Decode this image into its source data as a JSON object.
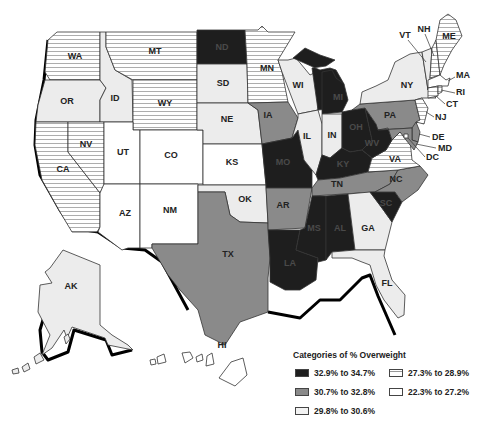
{
  "legend": {
    "title": "Categories of % Overweight",
    "categories": [
      {
        "label": "32.9% to 34.7%",
        "fill": "#1e1e1e",
        "pattern": "solid-dark"
      },
      {
        "label": "30.7% to 32.8%",
        "fill": "#8a8a8a",
        "pattern": "solid-gray"
      },
      {
        "label": "29.8% to 30.6%",
        "fill": "#ececec",
        "pattern": "light-dotted"
      },
      {
        "label": "27.3% to 28.9%",
        "fill": "#ffffff",
        "pattern": "horizontal-hatch"
      },
      {
        "label": "22.3% to 27.2%",
        "fill": "#ffffff",
        "pattern": "white"
      }
    ]
  },
  "states": {
    "WA": "WA",
    "OR": "OR",
    "CA": "CA",
    "ID": "ID",
    "NV": "NV",
    "MT": "MT",
    "WY": "WY",
    "UT": "UT",
    "AZ": "AZ",
    "CO": "CO",
    "NM": "NM",
    "ND": "ND",
    "SD": "SD",
    "NE": "NE",
    "KS": "KS",
    "OK": "OK",
    "TX": "TX",
    "MN": "MN",
    "IA": "IA",
    "MO": "MO",
    "AR": "AR",
    "LA": "LA",
    "WI": "WI",
    "IL": "IL",
    "MI": "MI",
    "IN": "IN",
    "OH": "OH",
    "KY": "KY",
    "TN": "TN",
    "MS": "MS",
    "AL": "AL",
    "GA": "GA",
    "FL": "FL",
    "SC": "SC",
    "NC": "NC",
    "VA": "VA",
    "WV": "WV",
    "PA": "PA",
    "NY": "NY",
    "VT": "VT",
    "NH": "NH",
    "ME": "ME",
    "MA": "MA",
    "RI": "RI",
    "CT": "CT",
    "NJ": "NJ",
    "DE": "DE",
    "MD": "MD",
    "DC": "DC",
    "AK": "AK",
    "HI": "HI"
  },
  "state_categories": {
    "32.9% to 34.7%": [
      "ND",
      "MI",
      "OH",
      "WV",
      "KY",
      "MO",
      "MS",
      "AL",
      "LA",
      "SC"
    ],
    "30.7% to 32.8%": [
      "IA",
      "PA",
      "TN",
      "AR",
      "TX",
      "NC",
      "DE",
      "MD"
    ],
    "29.8% to 30.6%": [
      "OR",
      "ID",
      "SD",
      "NE",
      "WI",
      "IL",
      "IN",
      "OK",
      "NY",
      "VT",
      "GA",
      "FL",
      "AK"
    ],
    "27.3% to 28.9%": [
      "WA",
      "MT",
      "WY",
      "MN",
      "CA",
      "NV",
      "VA",
      "NH",
      "ME",
      "RI",
      "CT",
      "NJ"
    ],
    "22.3% to 27.2%": [
      "UT",
      "CO",
      "KS",
      "AZ",
      "NM",
      "MA",
      "HI",
      "DC"
    ]
  }
}
